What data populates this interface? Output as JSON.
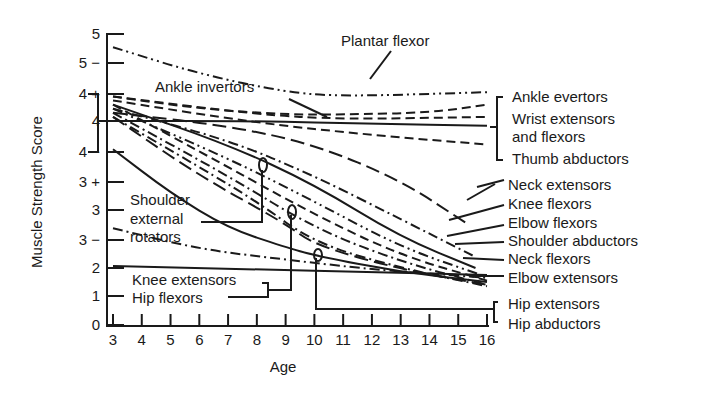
{
  "chart_data": {
    "type": "line",
    "title": "",
    "xlabel": "Age",
    "ylabel": "Muscle Strength Score",
    "x_ticks": [
      3,
      4,
      5,
      6,
      7,
      8,
      9,
      10,
      11,
      12,
      13,
      14,
      15,
      16
    ],
    "y_ticks": [
      {
        "label": "0",
        "value": 0,
        "py": 325
      },
      {
        "label": "1",
        "value": 1,
        "py": 296
      },
      {
        "label": "2",
        "value": 2,
        "py": 268
      },
      {
        "label": "3 −",
        "value": 2.67,
        "py": 240
      },
      {
        "label": "3",
        "value": 3,
        "py": 210
      },
      {
        "label": "3 +",
        "value": 3.33,
        "py": 182
      },
      {
        "label": "4 −",
        "value": 3.67,
        "py": 152
      },
      {
        "label": "4",
        "value": 4,
        "py": 121
      },
      {
        "label": "4 +",
        "value": 4.33,
        "py": 94
      },
      {
        "label": "5 −",
        "value": 4.67,
        "py": 63
      },
      {
        "label": "5",
        "value": 5,
        "py": 34
      }
    ],
    "xlim": [
      3,
      16
    ],
    "ylim": [
      0,
      5
    ],
    "grid": false,
    "legend": "direct labels",
    "series": [
      {
        "name": "Plantar flexor",
        "dash": "dashdotdot",
        "points": [
          [
            3,
            4.85
          ],
          [
            6,
            4.55
          ],
          [
            9,
            4.35
          ],
          [
            11,
            4.3
          ],
          [
            16,
            4.35
          ]
        ]
      },
      {
        "name": "Ankle invertors",
        "dash": "dash",
        "points": [
          [
            3,
            4.3
          ],
          [
            6,
            4.15
          ],
          [
            9,
            4.08
          ],
          [
            11,
            4.08
          ],
          [
            14,
            4.1
          ],
          [
            16,
            4.2
          ]
        ]
      },
      {
        "name": "Ankle evertors",
        "dash": "dash",
        "points": [
          [
            3,
            4.3
          ],
          [
            8,
            4.08
          ],
          [
            11,
            4.02
          ],
          [
            16,
            4.05
          ]
        ]
      },
      {
        "name": "Wrist extensors and flexors",
        "dash": "solid",
        "points": [
          [
            3,
            4.0
          ],
          [
            8,
            4.0
          ],
          [
            12,
            3.97
          ],
          [
            16,
            3.95
          ]
        ]
      },
      {
        "name": "Thumb abductors",
        "dash": "dash",
        "points": [
          [
            3,
            4.25
          ],
          [
            8,
            3.98
          ],
          [
            12,
            3.85
          ],
          [
            16,
            3.75
          ]
        ]
      },
      {
        "name": "Neck extensors",
        "dash": "longdash",
        "points": [
          [
            3,
            4.1
          ],
          [
            7,
            3.95
          ],
          [
            10,
            3.75
          ],
          [
            13,
            3.35
          ],
          [
            15.3,
            2.85
          ]
        ]
      },
      {
        "name": "Knee flexors",
        "dash": "dashdot",
        "points": [
          [
            3,
            4.15
          ],
          [
            7,
            3.8
          ],
          [
            10,
            3.4
          ],
          [
            13,
            2.9
          ],
          [
            15.5,
            2.3
          ]
        ]
      },
      {
        "name": "Elbow flexors",
        "dash": "solid",
        "points": [
          [
            3,
            4.2
          ],
          [
            7,
            3.75
          ],
          [
            10,
            3.3
          ],
          [
            13,
            2.7
          ],
          [
            15.6,
            2.0
          ]
        ]
      },
      {
        "name": "Shoulder abductors",
        "dash": "dashdotdot",
        "points": [
          [
            3,
            4.15
          ],
          [
            7,
            3.6
          ],
          [
            10,
            3.1
          ],
          [
            13,
            2.5
          ],
          [
            15.8,
            1.75
          ]
        ]
      },
      {
        "name": "Neck flexors",
        "dash": "dash",
        "points": [
          [
            3,
            4.2
          ],
          [
            7,
            3.5
          ],
          [
            10,
            2.95
          ],
          [
            13,
            2.3
          ],
          [
            16,
            1.55
          ]
        ]
      },
      {
        "name": "Elbow extensors",
        "dash": "dashdot",
        "points": [
          [
            3,
            4.1
          ],
          [
            7,
            3.4
          ],
          [
            10,
            2.8
          ],
          [
            13,
            2.15
          ],
          [
            16,
            1.4
          ]
        ]
      },
      {
        "name": "Shoulder external rotators",
        "dash": "dashdot",
        "points": [
          [
            3,
            4.05
          ],
          [
            6,
            3.5
          ],
          [
            8,
            3.1
          ],
          [
            10,
            2.6
          ],
          [
            13,
            2.0
          ],
          [
            16,
            1.35
          ]
        ]
      },
      {
        "name": "Knee extensors",
        "dash": "longdash",
        "points": [
          [
            3,
            4.05
          ],
          [
            6,
            3.4
          ],
          [
            9,
            2.85
          ],
          [
            10,
            2.55
          ],
          [
            13,
            1.95
          ],
          [
            16,
            1.4
          ]
        ]
      },
      {
        "name": "Hip flexors",
        "dash": "solid",
        "points": [
          [
            3,
            3.7
          ],
          [
            5,
            3.2
          ],
          [
            7,
            2.8
          ],
          [
            9,
            2.5
          ],
          [
            10,
            2.3
          ],
          [
            13,
            1.85
          ],
          [
            16,
            1.5
          ]
        ]
      },
      {
        "name": "Hip extensors",
        "dash": "dashdot",
        "points": [
          [
            3,
            2.8
          ],
          [
            6,
            2.45
          ],
          [
            9,
            2.2
          ],
          [
            12,
            1.95
          ],
          [
            14,
            1.8
          ],
          [
            16,
            1.65
          ]
        ]
      },
      {
        "name": "Hip abductors",
        "dash": "solid",
        "points": [
          [
            3,
            2.05
          ],
          [
            8,
            1.95
          ],
          [
            12,
            1.85
          ],
          [
            16,
            1.75
          ]
        ]
      }
    ]
  },
  "axes": {
    "x_title": "Age",
    "y_title": "Muscle Strength Score"
  },
  "labels": {
    "plantar_flexor": "Plantar flexor",
    "ankle_invertors": "Ankle invertors",
    "ankle_evertors": "Ankle evertors",
    "wrist_line1": "Wrist extensors",
    "wrist_line2": "and flexors",
    "thumb_abductors": "Thumb abductors",
    "neck_extensors": "Neck extensors",
    "knee_flexors": "Knee flexors",
    "elbow_flexors": "Elbow flexors",
    "shoulder_abductors": "Shoulder abductors",
    "neck_flexors": "Neck flexors",
    "elbow_extensors": "Elbow extensors",
    "hip_extensors": "Hip extensors",
    "hip_abductors": "Hip abductors",
    "shoulder_ext_line1": "Shoulder",
    "shoulder_ext_line2": "external",
    "shoulder_ext_line3": "rotators",
    "knee_extensors": "Knee extensors",
    "hip_flexors": "Hip flexors"
  },
  "colors": {
    "ink": "#1a1a1a",
    "background": "#ffffff"
  }
}
